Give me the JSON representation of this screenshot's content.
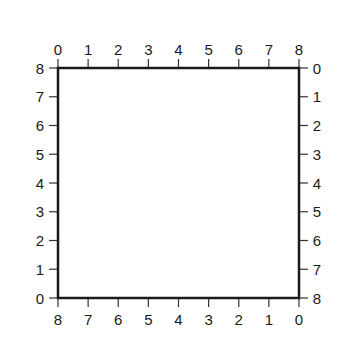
{
  "diagram": {
    "type": "grid-frame",
    "box": {
      "left": 58,
      "top": 68,
      "right": 299,
      "bottom": 298,
      "stroke": "#1a1a1a",
      "stroke_width": 2.5
    },
    "tick_length": 9,
    "axes": {
      "top": {
        "labels": [
          "0",
          "1",
          "2",
          "3",
          "4",
          "5",
          "6",
          "7",
          "8"
        ]
      },
      "bottom": {
        "labels": [
          "8",
          "7",
          "6",
          "5",
          "4",
          "3",
          "2",
          "1",
          "0"
        ]
      },
      "left": {
        "labels": [
          "8",
          "7",
          "6",
          "5",
          "4",
          "3",
          "2",
          "1",
          "0"
        ]
      },
      "right": {
        "labels": [
          "0",
          "1",
          "2",
          "3",
          "4",
          "5",
          "6",
          "7",
          "8"
        ]
      }
    }
  }
}
